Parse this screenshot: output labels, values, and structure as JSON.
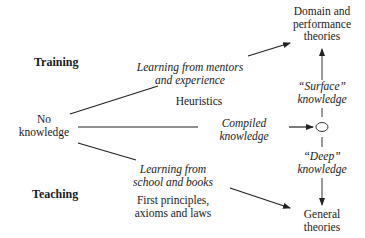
{
  "diagram": {
    "side_labels": {
      "training": "Training",
      "teaching": "Teaching"
    },
    "start_node": {
      "line1": "No",
      "line2": "knowledge"
    },
    "paths": {
      "upper": {
        "line1": "Learning from mentors",
        "line2": "and experience",
        "result": "Heuristics"
      },
      "middle": {
        "line1": "Compiled",
        "line2": "knowledge"
      },
      "lower": {
        "line1": "Learning from",
        "line2": "school and books",
        "result_line1": "First principles,",
        "result_line2": "axioms and laws"
      }
    },
    "right_column": {
      "top": {
        "line1": "Domain and",
        "line2": "performance",
        "line3": "theories"
      },
      "surface": {
        "line1": "“Surface”",
        "line2": "knowledge"
      },
      "deep": {
        "line1": "“Deep”",
        "line2": "knowledge"
      },
      "bottom": {
        "line1": "General",
        "line2": "theories"
      },
      "center_node": "circle-node"
    },
    "colors": {
      "line": "#222222",
      "text": "#1a1a1a",
      "background": "#ffffff"
    }
  }
}
